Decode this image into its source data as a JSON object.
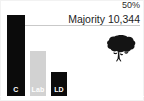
{
  "chart_data": {
    "type": "bar",
    "title": "",
    "subtitle": "",
    "categories": [
      "C",
      "Lab",
      "LD"
    ],
    "series": [
      {
        "name": "Vote share",
        "values": [
          56.5,
          31.5,
          16.5
        ]
      }
    ],
    "bar_colors": [
      "#0b0b0b",
      "#d2d2d2",
      "#0b0b0b"
    ],
    "xlabel": "",
    "ylabel": "",
    "ylim": [
      0,
      63
    ],
    "grid": true,
    "gridlines": [
      {
        "value": 50,
        "label": "50%"
      }
    ],
    "legend": "none",
    "annotations": [
      {
        "text": "Majority 10,344",
        "position": "top-right"
      }
    ]
  },
  "chart": {
    "threshold_label": "50%",
    "majority_text": "Majority 10,344",
    "bars": [
      {
        "label": "C",
        "value": 56.5,
        "color": "#0b0b0b",
        "label_color": "#ffffff"
      },
      {
        "label": "Lab",
        "value": 31.5,
        "color": "#d2d2d2",
        "label_color": "#ffffff"
      },
      {
        "label": "LD",
        "value": 16.5,
        "color": "#0b0b0b",
        "label_color": "#ffffff"
      }
    ],
    "logo_name": "conservative-party-oak-tree-logo",
    "background_color": "#ffffff",
    "gridline_color": "#c9c9c9"
  }
}
